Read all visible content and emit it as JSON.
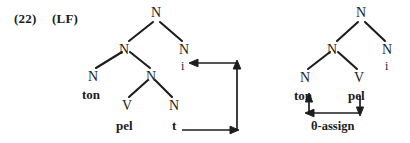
{
  "figure": {
    "example_number": "(22)",
    "representation_label": "(LF)",
    "background_color": "#ffffff",
    "ink_color": "#1d1d1d"
  },
  "left_tree": {
    "name": "lf-structure-before-movement",
    "nodes": {
      "root": "N",
      "right_branch": "N",
      "right_branch_index": "i",
      "inner_n": "N",
      "subject_n": "N",
      "subject_terminal": "ton",
      "vp_n": "N",
      "verb": "V",
      "verb_terminal": "pel",
      "trace_n": "N",
      "trace_terminal": "t"
    }
  },
  "right_tree": {
    "name": "theta-assignment-structure",
    "nodes": {
      "root": "N",
      "right_branch": "N",
      "right_branch_index": "i",
      "inner_n": "N",
      "subject_n": "N",
      "subject_terminal": "ton",
      "verb": "V",
      "verb_terminal": "pel"
    },
    "relation_label": "θ-assign"
  },
  "annotations": {
    "movement_arrow": "trace-to-index-movement-arrow",
    "theta_arrow": "theta-assign-relation-arrow"
  }
}
